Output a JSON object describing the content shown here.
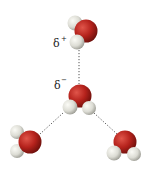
{
  "diagram": {
    "title": "",
    "labels": {
      "delta_plus": "δ",
      "delta_plus_sign": "+",
      "delta_minus": "δ",
      "delta_minus_sign": "−"
    },
    "molecules": [
      {
        "name": "top-water",
        "atoms": [
          "O",
          "H",
          "H"
        ]
      },
      {
        "name": "center-water",
        "atoms": [
          "O",
          "H",
          "H"
        ]
      },
      {
        "name": "left-water",
        "atoms": [
          "O",
          "H",
          "H"
        ]
      },
      {
        "name": "right-water",
        "atoms": [
          "O",
          "H",
          "H"
        ]
      }
    ],
    "bonds": [
      "hydrogen-bond",
      "hydrogen-bond",
      "hydrogen-bond"
    ],
    "colors": {
      "oxygen": "#b5221c",
      "oxygen_highlight": "#d8463c",
      "hydrogen": "#dcdcd4",
      "hydrogen_highlight": "#f4f4ee",
      "bond": "#555555"
    }
  }
}
